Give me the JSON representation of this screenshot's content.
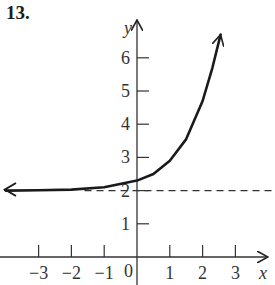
{
  "problem_label": "13.",
  "chart_data": {
    "type": "line",
    "title": "",
    "xlabel": "x",
    "ylabel": "y",
    "xlim": [
      -4,
      4
    ],
    "ylim": [
      0,
      7
    ],
    "x_ticks": [
      -3,
      -2,
      -1,
      1,
      2,
      3
    ],
    "x_tick_labels": [
      "−3",
      "−2",
      "−1",
      "1",
      "2",
      "3"
    ],
    "origin_label": "0",
    "y_ticks": [
      1,
      2,
      3,
      4,
      5,
      6
    ],
    "y_tick_labels": [
      "1",
      "2",
      "3",
      "4",
      "5",
      "6"
    ],
    "grid": false,
    "asymptote": {
      "type": "horizontal",
      "y": 2,
      "style": "dashed"
    },
    "series": [
      {
        "name": "exponential curve",
        "description": "increasing exponential with horizontal asymptote y = 2, arrows at both ends",
        "x": [
          -4.0,
          -3.0,
          -2.0,
          -1.0,
          0.0,
          0.5,
          1.0,
          1.5,
          2.0,
          2.3,
          2.55
        ],
        "y": [
          2.0,
          2.01,
          2.03,
          2.1,
          2.3,
          2.5,
          2.9,
          3.55,
          4.7,
          5.7,
          6.7
        ]
      }
    ]
  }
}
